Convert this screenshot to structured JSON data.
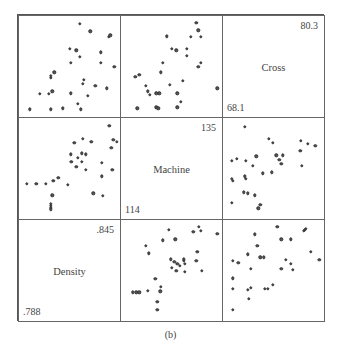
{
  "chart_data": {
    "type": "scatter",
    "subtype": "scatterplot-matrix",
    "caption": "(b)",
    "variables": [
      {
        "name": "Cross",
        "min": "68.1",
        "max": "80.3",
        "diag_position": [
          0,
          2
        ]
      },
      {
        "name": "Machine",
        "min": "114",
        "max": "135",
        "diag_position": [
          1,
          1
        ]
      },
      {
        "name": "Density",
        "min": ".788",
        "max": ".845",
        "diag_position": [
          2,
          0
        ]
      }
    ],
    "layout": {
      "rows": 3,
      "cols": 3,
      "grid": false,
      "axes_ticks": false
    },
    "panels": [
      {
        "row": 0,
        "col": 0,
        "points": [
          [
            0.6,
            0.04
          ],
          [
            0.71,
            0.12
          ],
          [
            0.9,
            0.18
          ],
          [
            0.92,
            0.16
          ],
          [
            0.49,
            0.3
          ],
          [
            0.56,
            0.32
          ],
          [
            0.6,
            0.39
          ],
          [
            0.82,
            0.34
          ],
          [
            0.5,
            0.45
          ],
          [
            0.82,
            0.45
          ],
          [
            0.96,
            0.49
          ],
          [
            0.33,
            0.55
          ],
          [
            0.29,
            0.59
          ],
          [
            0.29,
            0.61
          ],
          [
            0.64,
            0.63
          ],
          [
            0.63,
            0.67
          ],
          [
            0.76,
            0.69
          ],
          [
            0.88,
            0.72
          ],
          [
            0.18,
            0.78
          ],
          [
            0.27,
            0.78
          ],
          [
            0.31,
            0.75
          ],
          [
            0.5,
            0.77
          ],
          [
            0.68,
            0.8
          ],
          [
            0.58,
            0.88
          ],
          [
            0.61,
            0.94
          ],
          [
            0.42,
            0.93
          ],
          [
            0.29,
            0.94
          ],
          [
            0.07,
            0.94
          ]
        ]
      },
      {
        "row": 0,
        "col": 1,
        "points": [
          [
            0.75,
            0.03
          ],
          [
            0.77,
            0.11
          ],
          [
            0.69,
            0.18
          ],
          [
            0.8,
            0.18
          ],
          [
            0.44,
            0.17
          ],
          [
            0.49,
            0.3
          ],
          [
            0.54,
            0.32
          ],
          [
            0.65,
            0.3
          ],
          [
            0.65,
            0.38
          ],
          [
            0.8,
            0.45
          ],
          [
            0.77,
            0.49
          ],
          [
            0.4,
            0.45
          ],
          [
            0.38,
            0.55
          ],
          [
            0.11,
            0.6
          ],
          [
            0.15,
            0.58
          ],
          [
            0.22,
            0.69
          ],
          [
            0.24,
            0.75
          ],
          [
            0.26,
            0.79
          ],
          [
            0.33,
            0.77
          ],
          [
            0.36,
            0.77
          ],
          [
            0.47,
            0.68
          ],
          [
            0.61,
            0.64
          ],
          [
            0.55,
            0.77
          ],
          [
            0.59,
            0.86
          ],
          [
            0.33,
            0.92
          ],
          [
            0.35,
            0.93
          ],
          [
            0.55,
            0.92
          ],
          [
            0.13,
            0.93
          ],
          [
            0.97,
            0.72
          ]
        ]
      },
      {
        "row": 1,
        "col": 0,
        "points": [
          [
            0.91,
            0.04
          ],
          [
            0.95,
            0.19
          ],
          [
            0.99,
            0.21
          ],
          [
            0.63,
            0.18
          ],
          [
            0.54,
            0.22
          ],
          [
            0.72,
            0.21
          ],
          [
            0.93,
            0.27
          ],
          [
            0.5,
            0.34
          ],
          [
            0.62,
            0.33
          ],
          [
            0.66,
            0.34
          ],
          [
            0.58,
            0.38
          ],
          [
            0.51,
            0.42
          ],
          [
            0.62,
            0.42
          ],
          [
            0.56,
            0.47
          ],
          [
            0.66,
            0.5
          ],
          [
            0.83,
            0.43
          ],
          [
            0.94,
            0.5
          ],
          [
            0.83,
            0.57
          ],
          [
            0.37,
            0.59
          ],
          [
            0.32,
            0.62
          ],
          [
            0.24,
            0.65
          ],
          [
            0.47,
            0.66
          ],
          [
            0.14,
            0.65
          ],
          [
            0.04,
            0.65
          ],
          [
            0.31,
            0.77
          ],
          [
            0.74,
            0.75
          ],
          [
            0.84,
            0.78
          ],
          [
            0.29,
            0.86
          ],
          [
            0.29,
            0.88
          ],
          [
            0.29,
            0.9
          ],
          [
            0.29,
            0.92
          ]
        ]
      },
      {
        "row": 1,
        "col": 2,
        "points": [
          [
            0.19,
            0.05
          ],
          [
            0.44,
            0.18
          ],
          [
            0.48,
            0.22
          ],
          [
            0.78,
            0.2
          ],
          [
            0.85,
            0.23
          ],
          [
            0.93,
            0.25
          ],
          [
            0.77,
            0.3
          ],
          [
            0.31,
            0.36
          ],
          [
            0.52,
            0.35
          ],
          [
            0.59,
            0.35
          ],
          [
            0.55,
            0.4
          ],
          [
            0.57,
            0.44
          ],
          [
            0.79,
            0.46
          ],
          [
            0.05,
            0.41
          ],
          [
            0.1,
            0.39
          ],
          [
            0.2,
            0.41
          ],
          [
            0.27,
            0.46
          ],
          [
            0.38,
            0.54
          ],
          [
            0.47,
            0.53
          ],
          [
            0.19,
            0.57
          ],
          [
            0.2,
            0.6
          ],
          [
            0.05,
            0.6
          ],
          [
            0.06,
            0.62
          ],
          [
            0.18,
            0.74
          ],
          [
            0.22,
            0.75
          ],
          [
            0.29,
            0.77
          ],
          [
            0.05,
            0.85
          ],
          [
            0.35,
            0.87
          ],
          [
            0.33,
            0.91
          ]
        ]
      },
      {
        "row": 2,
        "col": 1,
        "points": [
          [
            0.78,
            0.03
          ],
          [
            0.8,
            0.07
          ],
          [
            0.72,
            0.08
          ],
          [
            0.97,
            0.1
          ],
          [
            0.46,
            0.06
          ],
          [
            0.53,
            0.16
          ],
          [
            0.4,
            0.17
          ],
          [
            0.22,
            0.23
          ],
          [
            0.25,
            0.31
          ],
          [
            0.48,
            0.37
          ],
          [
            0.62,
            0.37
          ],
          [
            0.52,
            0.4
          ],
          [
            0.55,
            0.42
          ],
          [
            0.58,
            0.44
          ],
          [
            0.63,
            0.42
          ],
          [
            0.62,
            0.39
          ],
          [
            0.49,
            0.46
          ],
          [
            0.54,
            0.49
          ],
          [
            0.63,
            0.5
          ],
          [
            0.76,
            0.29
          ],
          [
            0.75,
            0.39
          ],
          [
            0.81,
            0.49
          ],
          [
            0.32,
            0.58
          ],
          [
            0.38,
            0.66
          ],
          [
            0.37,
            0.71
          ],
          [
            0.24,
            0.7
          ],
          [
            0.08,
            0.72
          ],
          [
            0.12,
            0.72
          ],
          [
            0.15,
            0.72
          ],
          [
            0.34,
            0.82
          ],
          [
            0.34,
            0.9
          ]
        ]
      },
      {
        "row": 2,
        "col": 2,
        "points": [
          [
            0.53,
            0.03
          ],
          [
            0.81,
            0.07
          ],
          [
            0.82,
            0.06
          ],
          [
            0.83,
            0.05
          ],
          [
            0.29,
            0.11
          ],
          [
            0.57,
            0.16
          ],
          [
            0.67,
            0.16
          ],
          [
            0.32,
            0.23
          ],
          [
            0.22,
            0.32
          ],
          [
            0.35,
            0.35
          ],
          [
            0.39,
            0.35
          ],
          [
            0.62,
            0.38
          ],
          [
            0.67,
            0.42
          ],
          [
            0.69,
            0.48
          ],
          [
            0.57,
            0.47
          ],
          [
            0.88,
            0.29
          ],
          [
            0.97,
            0.38
          ],
          [
            0.06,
            0.39
          ],
          [
            0.12,
            0.41
          ],
          [
            0.25,
            0.47
          ],
          [
            0.06,
            0.57
          ],
          [
            0.06,
            0.68
          ],
          [
            0.25,
            0.67
          ],
          [
            0.22,
            0.69
          ],
          [
            0.4,
            0.68
          ],
          [
            0.43,
            0.68
          ],
          [
            0.48,
            0.64
          ],
          [
            0.23,
            0.79
          ],
          [
            0.06,
            0.9
          ]
        ]
      }
    ]
  },
  "labels": {
    "cross": {
      "name": "Cross",
      "min": "68.1",
      "max": "80.3"
    },
    "machine": {
      "name": "Machine",
      "min": "114",
      "max": "135"
    },
    "density": {
      "name": "Density",
      "min": ".788",
      "max": ".845"
    },
    "caption": "(b)"
  }
}
